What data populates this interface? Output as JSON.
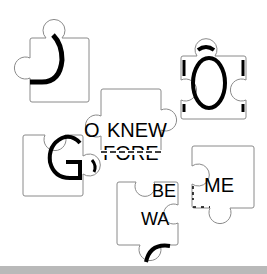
{
  "game": {
    "type": "jigsaw-word-puzzle",
    "pieces": [
      {
        "id": "piece-d",
        "label": "D",
        "x": 30,
        "y": 38
      },
      {
        "id": "piece-o",
        "label": "O",
        "x": 181,
        "y": 56
      },
      {
        "id": "piece-knew",
        "label": "KNEW",
        "sub_label": "FORE",
        "x": 101,
        "y": 89
      },
      {
        "id": "piece-g",
        "label": "G",
        "x": 23,
        "y": 135
      },
      {
        "id": "piece-be-wa",
        "label": "BE",
        "sub_label": "WA",
        "x": 117,
        "y": 182
      },
      {
        "id": "piece-me",
        "label": "ME",
        "x": 192,
        "y": 146
      }
    ],
    "knew_prefix": "O",
    "colors": {
      "background": "#ffffff",
      "outline": "#8a8a8a",
      "text": "#000000",
      "bottom_bar": "#b9b9b9"
    }
  }
}
